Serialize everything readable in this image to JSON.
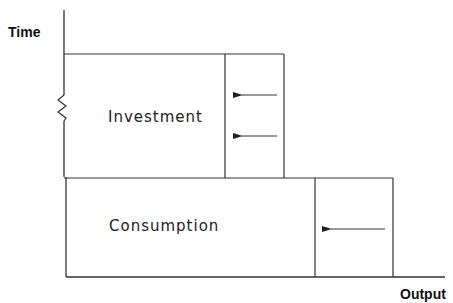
{
  "axes": {
    "y_label": "Time",
    "x_label": "Output"
  },
  "boxes": {
    "investment": {
      "label": "Investment",
      "arrow_count": 2
    },
    "consumption": {
      "label": "Consumption",
      "arrow_count": 1
    }
  },
  "colors": {
    "line": "#333333",
    "text": "#222222",
    "background": "#ffffff"
  }
}
